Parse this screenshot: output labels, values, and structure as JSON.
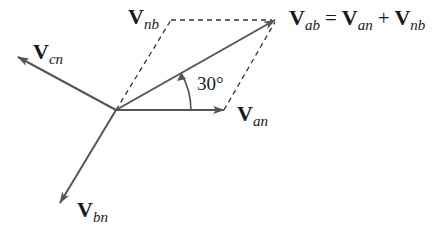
{
  "diagram": {
    "type": "phasor-diagram",
    "colors": {
      "arrow": "#555555",
      "dashed": "#333333",
      "text": "#1a1a1a"
    },
    "origin": [
      116,
      110
    ],
    "phasors": [
      {
        "id": "V_an",
        "symbol": "V",
        "subscript": "an",
        "tip": [
          224,
          110
        ]
      },
      {
        "id": "V_bn",
        "symbol": "V",
        "subscript": "bn",
        "tip": [
          60,
          203
        ]
      },
      {
        "id": "V_cn",
        "symbol": "V",
        "subscript": "cn",
        "tip": [
          18,
          57
        ]
      },
      {
        "id": "V_ab",
        "symbol": "V",
        "subscript": "ab",
        "tip": [
          275,
          20
        ]
      }
    ],
    "construction": {
      "V_nb": {
        "symbol": "V",
        "subscript": "nb",
        "corner": [
          171,
          20
        ]
      }
    },
    "angle_label": "30°",
    "equation": {
      "lhs": {
        "symbol": "V",
        "subscript": "ab"
      },
      "equals": "=",
      "term1": {
        "symbol": "V",
        "subscript": "an"
      },
      "plus": "+",
      "term2": {
        "symbol": "V",
        "subscript": "nb"
      }
    }
  }
}
